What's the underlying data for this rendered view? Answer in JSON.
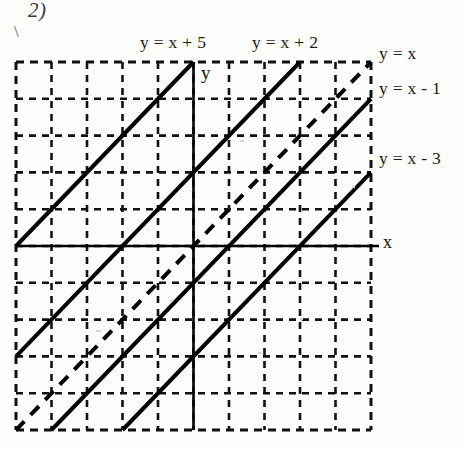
{
  "page": {
    "problem_number": "2)",
    "stray_mark": "\\",
    "background_color": "#fdfdfb",
    "ink_color": "#111111"
  },
  "axis_labels": {
    "x": "x",
    "y": "y"
  },
  "labels": {
    "top": [
      {
        "text": "y = x + 5",
        "name": "label-y-eq-x-plus-5"
      },
      {
        "text": "y = x + 2",
        "name": "label-y-eq-x-plus-2"
      }
    ],
    "right": [
      {
        "text": "y = x",
        "name": "label-y-eq-x"
      },
      {
        "text": "y = x - 1",
        "name": "label-y-eq-x-minus-1"
      },
      {
        "text": "y = x - 3",
        "name": "label-y-eq-x-minus-3"
      }
    ]
  },
  "chart_data": {
    "type": "line",
    "title": "",
    "subtitle": "",
    "xlabel": "x",
    "ylabel": "y",
    "xlim": [
      -5,
      5
    ],
    "ylim": [
      -5,
      5
    ],
    "xticks": [
      -5,
      -4,
      -3,
      -2,
      -1,
      0,
      1,
      2,
      3,
      4,
      5
    ],
    "yticks": [
      -5,
      -4,
      -3,
      -2,
      -1,
      0,
      1,
      2,
      3,
      4,
      5
    ],
    "grid": true,
    "grid_style": "dashed",
    "grid_spacing": 1,
    "legend_position": "inline-annotations",
    "axes_drawn": [
      "x-axis",
      "y-axis"
    ],
    "series": [
      {
        "name": "y = x + 5",
        "equation": "y = x + 5",
        "slope": 1,
        "intercept": 5,
        "style": "solid",
        "color": "#000000",
        "x": [
          -5,
          0
        ],
        "y": [
          0,
          5
        ]
      },
      {
        "name": "y = x + 2",
        "equation": "y = x + 2",
        "slope": 1,
        "intercept": 2,
        "style": "solid",
        "color": "#000000",
        "x": [
          -5,
          3
        ],
        "y": [
          -3,
          5
        ]
      },
      {
        "name": "y = x",
        "equation": "y = x",
        "slope": 1,
        "intercept": 0,
        "style": "dashed",
        "color": "#000000",
        "x": [
          -5,
          5
        ],
        "y": [
          -5,
          5
        ]
      },
      {
        "name": "y = x - 1",
        "equation": "y = x - 1",
        "slope": 1,
        "intercept": -1,
        "style": "solid",
        "color": "#000000",
        "x": [
          -4,
          5
        ],
        "y": [
          -5,
          4
        ]
      },
      {
        "name": "y = x - 3",
        "equation": "y = x - 3",
        "slope": 1,
        "intercept": -3,
        "style": "solid",
        "color": "#000000",
        "x": [
          -2,
          5
        ],
        "y": [
          -5,
          2
        ]
      }
    ]
  }
}
